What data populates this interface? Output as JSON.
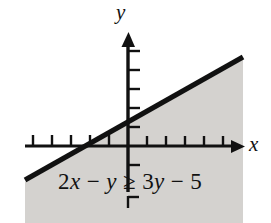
{
  "figure": {
    "kind": "cartesian-inequality-graph",
    "background_color": "#ffffff",
    "ink_color": "#111111",
    "shade_color": "#d4d2cf"
  },
  "axes": {
    "x_label": "x",
    "y_label": "y",
    "origin": {
      "x": 128,
      "y": 146
    },
    "x_axis": {
      "start_x": 25,
      "end_x": 243,
      "y": 146,
      "arrow": "right"
    },
    "y_axis": {
      "x": 128,
      "start_y": 192,
      "end_y": 33,
      "arrow": "up"
    },
    "tick_spacing": 19,
    "x_ticks_left": [
      109,
      90,
      71,
      52,
      33
    ],
    "x_ticks_right": [
      147,
      166,
      185,
      204,
      223
    ],
    "y_ticks_up": [
      127,
      108,
      89,
      70,
      51
    ],
    "y_ticks_down": [
      165
    ],
    "y_tick_detached": [
      203
    ]
  },
  "line": {
    "description": "boundary line of the inequality, drawn solid and bold",
    "style": "solid",
    "thickness_px": 5,
    "from": {
      "x": 25,
      "y": 180
    },
    "to": {
      "x": 243,
      "y": 57
    },
    "x_intercept_px": 90,
    "y_intercept_px": 122
  },
  "shaded_region": {
    "description": "region satisfying the inequality, below and right of the boundary line",
    "color": "#d4d2cf",
    "bounds": {
      "left": 25,
      "right": 243,
      "bottom": 223
    }
  },
  "inequality": {
    "full": "2x − y ≥ 3y − 5",
    "lhs_coef": "2",
    "lhs_var": "x",
    "minus": "−",
    "lhs_var2": "y",
    "relation": "≥",
    "rhs_coef": "3",
    "rhs_var": "y",
    "rhs_const": "5"
  }
}
